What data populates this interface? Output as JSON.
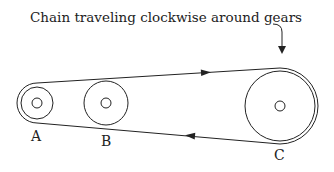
{
  "caption": "Chain traveling clockwise around gears",
  "gears": [
    {
      "label": "A",
      "cx": 37,
      "cy": 103,
      "r": 16,
      "hub": 5
    },
    {
      "label": "B",
      "cx": 106,
      "cy": 103,
      "r": 22,
      "hub": 5
    },
    {
      "label": "C",
      "cx": 280,
      "cy": 106,
      "r": 35,
      "hub": 5
    }
  ],
  "chain": {
    "direction": "clockwise",
    "color": "#222222"
  }
}
